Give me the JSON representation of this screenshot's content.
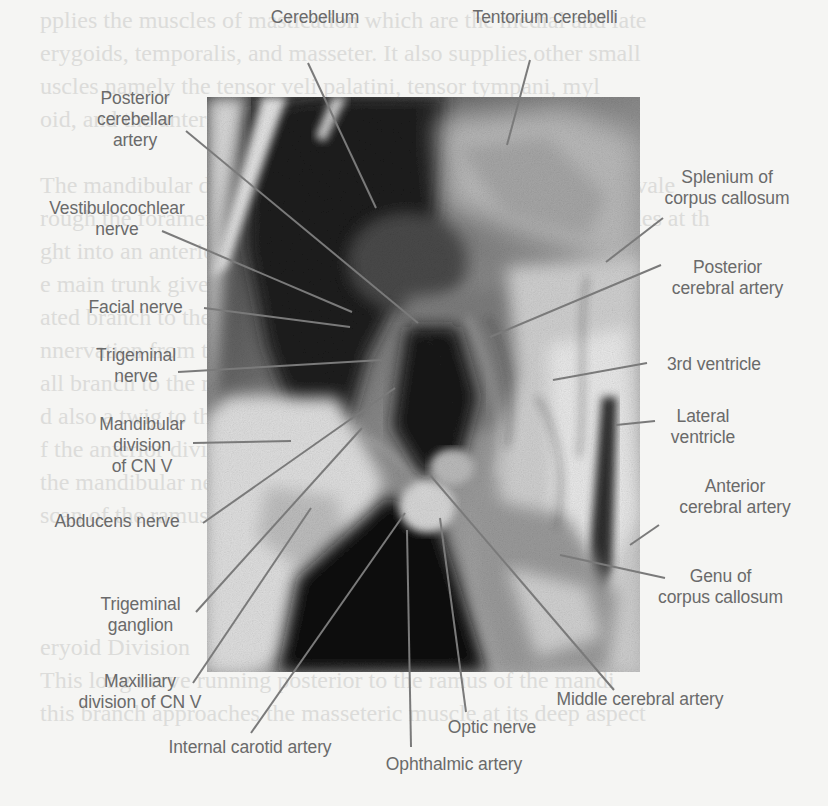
{
  "figure": {
    "type": "labeled anatomical dissection photograph",
    "photo": {
      "x": 207,
      "y": 97,
      "width": 433,
      "height": 575,
      "mode": "grayscale"
    },
    "label_color": "#6a6a6a",
    "leader_color": "#7a7a7a",
    "background_color": "#f5f5f3"
  },
  "background_text": {
    "note": "faint show-through of printed text from reverse page",
    "lines": [
      {
        "x": 40,
        "y": 4,
        "text": "pplies the muscles of mastication which are the medial and late"
      },
      {
        "x": 40,
        "y": 37,
        "text": "erygoids, temporalis, and masseter. It also supplies other small"
      },
      {
        "x": 40,
        "y": 70,
        "text": "uscles namely the tensor veli palatini, tensor tympani, myl"
      },
      {
        "x": 40,
        "y": 103,
        "text": "oid, and the anterior belly of digastric."
      },
      {
        "x": 40,
        "y": 169,
        "text": "The mandibular division exits the skull through the foramen ovale"
      },
      {
        "x": 40,
        "y": 202,
        "text": "rough the foramen ovale into the infratemporal fossa and divides at th"
      },
      {
        "x": 40,
        "y": 235,
        "text": "ght into an anterior and posterior trunks (Figure 5"
      },
      {
        "x": 40,
        "y": 268,
        "text": "e main trunk gives off branches before the first sm"
      },
      {
        "x": 40,
        "y": 301,
        "text": "ated branch to the medial pterygoid muscle and recu"
      },
      {
        "x": 40,
        "y": 334,
        "text": "nnervation from the infratemporal fossa. The secon"
      },
      {
        "x": 40,
        "y": 367,
        "text": "all branch to the medial pterygoid and the pterygo"
      },
      {
        "x": 40,
        "y": 400,
        "text": "d also a twig to the tensor veli and tensor palati"
      },
      {
        "x": 40,
        "y": 433,
        "text": "f the anterior division branches from the main tru"
      },
      {
        "x": 40,
        "y": 466,
        "text": "the mandibular nerve. Its branches have bee"
      },
      {
        "x": 40,
        "y": 499,
        "text": "scan of the ramus (Figure 5.3-5.5)."
      },
      {
        "x": 40,
        "y": 631,
        "text": "eryoid Division"
      },
      {
        "x": 40,
        "y": 664,
        "text": "This long nerve running posterior to the ramus of the mandi"
      },
      {
        "x": 40,
        "y": 697,
        "text": "this branch approaches the masseteric muscle at its deep aspect"
      }
    ]
  },
  "labels": [
    {
      "id": "cerebellum",
      "text": "Cerebellum",
      "x": 255,
      "y": 7,
      "w": 120,
      "anchor": [
        308,
        63
      ],
      "target": [
        376,
        208
      ]
    },
    {
      "id": "tentorium-cerebelli",
      "text": "Tentorium cerebelli",
      "x": 460,
      "y": 7,
      "w": 170,
      "anchor": [
        530,
        60
      ],
      "target": [
        507,
        145
      ]
    },
    {
      "id": "posterior-cerebellar-artery",
      "text": "Posterior\ncerebellar\nartery",
      "x": 80,
      "y": 88,
      "w": 110,
      "anchor": [
        186,
        131
      ],
      "target": [
        418,
        323
      ]
    },
    {
      "id": "vestibulocochlear-nerve",
      "text": "Vestibulocochlear\nnerve",
      "x": 28,
      "y": 198,
      "w": 178,
      "anchor": [
        162,
        231
      ],
      "target": [
        352,
        312
      ]
    },
    {
      "id": "facial-nerve",
      "text": "Facial nerve",
      "x": 73,
      "y": 297,
      "w": 125,
      "anchor": [
        204,
        308
      ],
      "target": [
        350,
        327
      ]
    },
    {
      "id": "trigeminal-nerve",
      "text": "Trigeminal\nnerve",
      "x": 80,
      "y": 345,
      "w": 112,
      "anchor": [
        178,
        372
      ],
      "target": [
        382,
        360
      ]
    },
    {
      "id": "mandibular-division",
      "text": "Mandibular\ndivision\nof CN V",
      "x": 88,
      "y": 414,
      "w": 108,
      "anchor": [
        193,
        443
      ],
      "target": [
        291,
        441
      ]
    },
    {
      "id": "abducens-nerve",
      "text": "Abducens nerve",
      "x": 37,
      "y": 511,
      "w": 160,
      "anchor": [
        203,
        523
      ],
      "target": [
        395,
        388
      ]
    },
    {
      "id": "trigeminal-ganglion",
      "text": "Trigeminal\nganglion",
      "x": 88,
      "y": 594,
      "w": 105,
      "anchor": [
        196,
        612
      ],
      "target": [
        362,
        428
      ]
    },
    {
      "id": "maxilliary-division",
      "text": "Maxilliary\ndivision of CN V",
      "x": 60,
      "y": 671,
      "w": 160,
      "anchor": [
        193,
        683
      ],
      "target": [
        311,
        508
      ]
    },
    {
      "id": "internal-carotid-artery",
      "text": "Internal carotid artery",
      "x": 150,
      "y": 737,
      "w": 200,
      "anchor": [
        251,
        733
      ],
      "target": [
        405,
        513
      ]
    },
    {
      "id": "ophthalmic-artery",
      "text": "Ophthalmic artery",
      "x": 366,
      "y": 754,
      "w": 176,
      "anchor": [
        411,
        747
      ],
      "target": [
        407,
        530
      ]
    },
    {
      "id": "optic-nerve",
      "text": "Optic nerve",
      "x": 436,
      "y": 717,
      "w": 112,
      "anchor": [
        466,
        712
      ],
      "target": [
        440,
        518
      ]
    },
    {
      "id": "middle-cerebral-artery",
      "text": "Middle cerebral artery",
      "x": 540,
      "y": 689,
      "w": 200,
      "anchor": [
        614,
        690
      ],
      "target": [
        430,
        475
      ]
    },
    {
      "id": "genu-corpus-callosum",
      "text": "Genu of\ncorpus callosum",
      "x": 643,
      "y": 566,
      "w": 155,
      "anchor": [
        665,
        578
      ],
      "target": [
        560,
        555
      ]
    },
    {
      "id": "anterior-cerebral-artery",
      "text": "Anterior\ncerebral artery",
      "x": 660,
      "y": 476,
      "w": 150,
      "anchor": [
        659,
        525
      ],
      "target": [
        630,
        545
      ]
    },
    {
      "id": "lateral-ventricle",
      "text": "Lateral\nventricle",
      "x": 663,
      "y": 406,
      "w": 80,
      "anchor": [
        655,
        421
      ],
      "target": [
        616,
        425
      ]
    },
    {
      "id": "third-ventricle",
      "text": "3rd ventricle",
      "x": 654,
      "y": 354,
      "w": 120,
      "anchor": [
        647,
        363
      ],
      "target": [
        553,
        380
      ]
    },
    {
      "id": "posterior-cerebral-artery",
      "text": "Posterior\ncerebral artery",
      "x": 645,
      "y": 257,
      "w": 165,
      "anchor": [
        661,
        265
      ],
      "target": [
        490,
        337
      ]
    },
    {
      "id": "splenium-corpus-callosum",
      "text": "Splenium of\ncorpus callosum",
      "x": 643,
      "y": 167,
      "w": 168,
      "anchor": [
        663,
        218
      ],
      "target": [
        606,
        262
      ]
    }
  ]
}
